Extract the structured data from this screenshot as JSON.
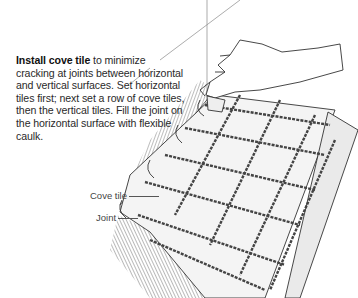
{
  "caption": {
    "bold_lead": "Install cove tile",
    "text": " to minimize cracking at joints between horizontal and vertical surfaces. Set horizontal tiles first; next set a row of cove tiles, then the vertical tiles. Fill the joint on the horizontal surface with flexible caulk."
  },
  "labels": {
    "cove_tile": "Cove tile",
    "joint": "Joint"
  },
  "illustration": {
    "subject": "hand setting square tiles on a horizontal surface with cove tiles at the wall joint",
    "colors": {
      "line": "#333333",
      "tile_fill": "#f2f2f2",
      "grout": "#555555",
      "background": "#ffffff"
    }
  }
}
